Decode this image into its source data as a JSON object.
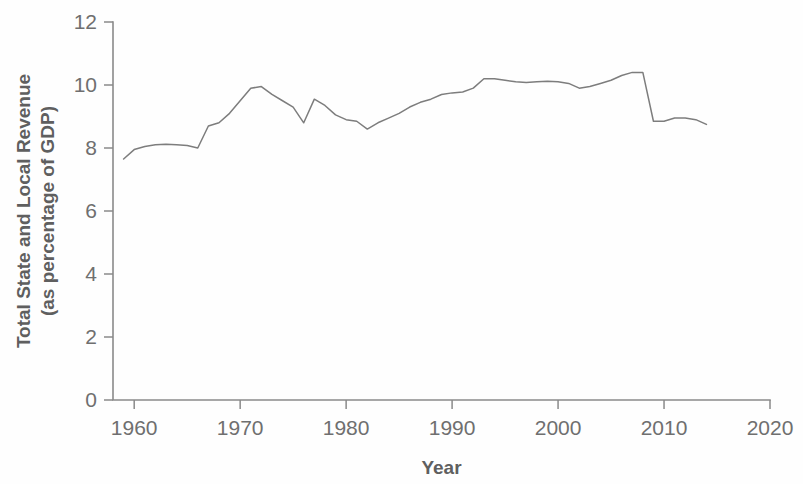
{
  "chart_data": {
    "type": "line",
    "title": "",
    "xlabel": "Year",
    "ylabel": "Total State and Local Revenue (as percentage of GDP)",
    "ylabel_line1": "Total State and Local Revenue",
    "ylabel_line2": "(as percentage of GDP)",
    "xlim": [
      1958,
      2020
    ],
    "ylim": [
      0,
      12
    ],
    "xticks": [
      1960,
      1970,
      1980,
      1990,
      2000,
      2010,
      2020
    ],
    "xtick_labels": [
      "1960",
      "1970",
      "1980",
      "1990",
      "2000",
      "2010",
      "2020"
    ],
    "yticks": [
      0,
      2,
      4,
      6,
      8,
      10,
      12
    ],
    "ytick_labels": [
      "0",
      "2",
      "4",
      "6",
      "8",
      "10",
      "12"
    ],
    "grid": false,
    "legend": false,
    "line_color": "#7d7d7d",
    "axis_color": "#8a8a8a",
    "background_color": "#fefefe",
    "x": [
      1959,
      1960,
      1961,
      1962,
      1963,
      1964,
      1965,
      1966,
      1967,
      1968,
      1969,
      1970,
      1971,
      1972,
      1973,
      1974,
      1975,
      1976,
      1977,
      1978,
      1979,
      1980,
      1981,
      1982,
      1983,
      1984,
      1985,
      1986,
      1987,
      1988,
      1989,
      1990,
      1991,
      1992,
      1993,
      1994,
      1995,
      1996,
      1997,
      1998,
      1999,
      2000,
      2001,
      2002,
      2003,
      2004,
      2005,
      2006,
      2007,
      2008,
      2009,
      2010,
      2011,
      2012,
      2013,
      2014
    ],
    "values": [
      7.65,
      7.95,
      8.05,
      8.1,
      8.12,
      8.1,
      8.08,
      8.0,
      8.7,
      8.8,
      9.1,
      9.5,
      9.9,
      9.95,
      9.7,
      9.5,
      9.3,
      8.8,
      9.55,
      9.35,
      9.05,
      8.9,
      8.85,
      8.6,
      8.8,
      8.95,
      9.1,
      9.3,
      9.45,
      9.55,
      9.7,
      9.75,
      9.78,
      9.9,
      10.2,
      10.2,
      10.15,
      10.1,
      10.08,
      10.1,
      10.12,
      10.1,
      10.05,
      9.9,
      9.95,
      10.05,
      10.15,
      10.3,
      10.4,
      10.4,
      8.85,
      8.85,
      8.95,
      8.95,
      8.9,
      8.75
    ],
    "series_name": "Total State and Local Revenue"
  },
  "notes": {
    "peak_1972": 9.95,
    "peak_2008": 10.4,
    "drop_2009": 8.85,
    "start_1959": 7.65,
    "end_2014": 8.75
  }
}
